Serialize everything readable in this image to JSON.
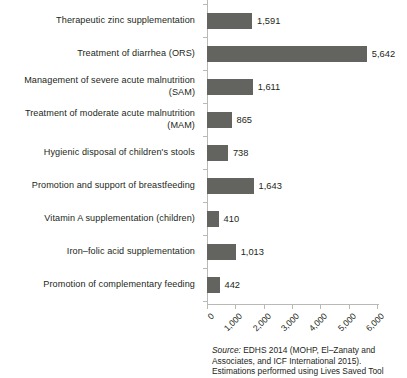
{
  "chart_data": {
    "type": "bar",
    "orientation": "horizontal",
    "title": "",
    "xlabel": "",
    "ylabel": "",
    "xlim": [
      0,
      6000
    ],
    "grid": false,
    "legend": null,
    "bar_color": "#63635f",
    "axis_color": "#b9b9b6",
    "categories": [
      "Therapeutic zinc supplementation",
      "Treatment of diarrhea (ORS)",
      "Management of severe acute malnutrition (SAM)",
      "Treatment of moderate acute malnutrition (MAM)",
      "Hygienic disposal of children's stools",
      "Promotion and support of breastfeeding",
      "Vitamin A supplementation (children)",
      "Iron–folic acid supplementation",
      "Promotion of complementary feeding"
    ],
    "category_lines": [
      [
        "Therapeutic zinc supplementation"
      ],
      [
        "Treatment of diarrhea (ORS)"
      ],
      [
        "Management of severe acute malnutrition",
        "(SAM)"
      ],
      [
        "Treatment of moderate acute malnutrition",
        "(MAM)"
      ],
      [
        "Hygienic disposal of children's stools"
      ],
      [
        "Promotion and support of breastfeeding"
      ],
      [
        "Vitamin A supplementation (children)"
      ],
      [
        "Iron–folic acid supplementation"
      ],
      [
        "Promotion of complementary feeding"
      ]
    ],
    "values": [
      1591,
      5642,
      1611,
      865,
      738,
      1643,
      410,
      1013,
      442
    ],
    "value_labels": [
      "1,591",
      "5,642",
      "1,611",
      "865",
      "738",
      "1,643",
      "410",
      "1,013",
      "442"
    ],
    "xticks": [
      0,
      1000,
      2000,
      3000,
      4000,
      5000,
      6000
    ],
    "xtick_labels": [
      "0",
      "1,000",
      "2,000",
      "3,000",
      "4,000",
      "5,000",
      "6,000"
    ]
  },
  "source": {
    "lead": "Source:",
    "lines": [
      "EDHS 2014 (MOHP, El–Zanaty and",
      "Associates, and ICF International 2015).",
      "Estimations performed using Lives Saved Tool"
    ]
  }
}
